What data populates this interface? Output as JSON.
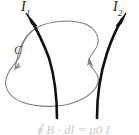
{
  "figure": {
    "width": 139,
    "height": 135,
    "background_color": "#ffffff"
  },
  "labels": {
    "current_1": {
      "symbol": "I",
      "subscript": "1"
    },
    "current_2": {
      "symbol": "I",
      "subscript": "2"
    },
    "contour": {
      "text": "C"
    }
  },
  "formula": {
    "text": "∮ B · dl = μ0 I"
  },
  "colors": {
    "wire": "#111111",
    "loop": "#7d7d7d",
    "label": "#1a1a1a",
    "contour_label": "#4a4a4a",
    "formula": "#8e8e8e"
  },
  "elements": {
    "wire_1_name": "current-wire-I1",
    "wire_2_name": "current-wire-I2",
    "loop_name": "ampere-contour-loop",
    "arrow_1_name": "arrowhead-I1",
    "arrow_2_name": "arrowhead-I2",
    "loop_arrow_left_name": "loop-direction-arrowhead-left",
    "loop_arrow_right_name": "loop-direction-arrowhead-right"
  }
}
